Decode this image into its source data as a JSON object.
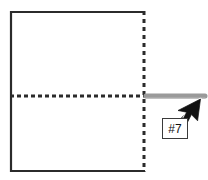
{
  "canvas": {
    "width": 208,
    "height": 180,
    "background_color": "#ffffff"
  },
  "diagram": {
    "type": "technical-sketch",
    "shapes": {
      "panel": {
        "name": "panel-rectangle",
        "x": 10,
        "y": 11,
        "width": 135,
        "height": 161,
        "stroke_color": "#2b2b2b",
        "stroke_width": 2,
        "fill": "#ffffff",
        "solid_edges": [
          "left",
          "top",
          "bottom"
        ],
        "dashed_edges": [
          "right"
        ]
      },
      "center_line": {
        "name": "horizontal-dashed-centerline",
        "x1": 10,
        "y1": 96,
        "x2": 145,
        "y2": 96,
        "stroke_color": "#2b2b2b",
        "stroke_width": 3,
        "dash": "4 3"
      },
      "right_edge_line": {
        "name": "vertical-dashed-edge",
        "x1": 144,
        "y1": 11,
        "x2": 144,
        "y2": 172,
        "stroke_color": "#2b2b2b",
        "stroke_width": 3,
        "dash": "4 4"
      },
      "highlight_bar": {
        "name": "gray-highlight-bar",
        "x1": 144,
        "y1": 96,
        "x2": 206,
        "y2": 96,
        "stroke_color": "#9a9a9a",
        "stroke_width": 5,
        "linecap": "round"
      }
    }
  },
  "cursor": {
    "name": "mouse-pointer",
    "tip_x": 199,
    "tip_y": 100,
    "direction": "up-right",
    "fill_color": "#111111",
    "outline_color": "#ffffff"
  },
  "callout": {
    "label": "#7",
    "box": {
      "x": 162,
      "y": 118,
      "width": 26,
      "height": 21,
      "border_color": "#3a3a3a",
      "background_color": "#ffffff",
      "text_color": "#111111"
    }
  }
}
